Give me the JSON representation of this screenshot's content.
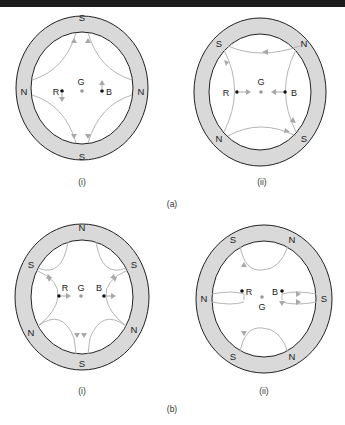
{
  "figure": {
    "part_a": {
      "label": "(a)",
      "sub_i": {
        "caption": "(i)",
        "poles": {
          "top": "S",
          "bottom": "S",
          "left": "N",
          "right": "N"
        },
        "points": {
          "red": "R",
          "green": "G",
          "blue": "B"
        }
      },
      "sub_ii": {
        "caption": "(ii)",
        "poles": {
          "top_left": "S",
          "top_right": "N",
          "bottom_left": "N",
          "bottom_right": "S"
        },
        "points": {
          "red": "R",
          "green": "G",
          "blue": "B"
        }
      }
    },
    "part_b": {
      "label": "(b)",
      "sub_i": {
        "caption": "(i)",
        "poles": {
          "top": "N",
          "upper_left": "S",
          "upper_right": "S",
          "lower_left": "N",
          "lower_right": "N",
          "bottom": "S"
        },
        "points": {
          "red": "R",
          "green": "G",
          "blue": "B"
        }
      },
      "sub_ii": {
        "caption": "(ii)",
        "poles": {
          "upper_left": "S",
          "upper_right": "N",
          "left": "N",
          "right": "S",
          "lower_left": "S",
          "lower_right": "N"
        },
        "points": {
          "red": "R",
          "green": "G",
          "blue": "B"
        }
      }
    }
  },
  "colors": {
    "ring_fill": "#d9d9d9",
    "ring_stroke": "#222222",
    "field_line": "#b5b5b5",
    "arrow": "#a8a8a8",
    "point_dark": "#111111",
    "point_green": "#9a9a9a"
  }
}
